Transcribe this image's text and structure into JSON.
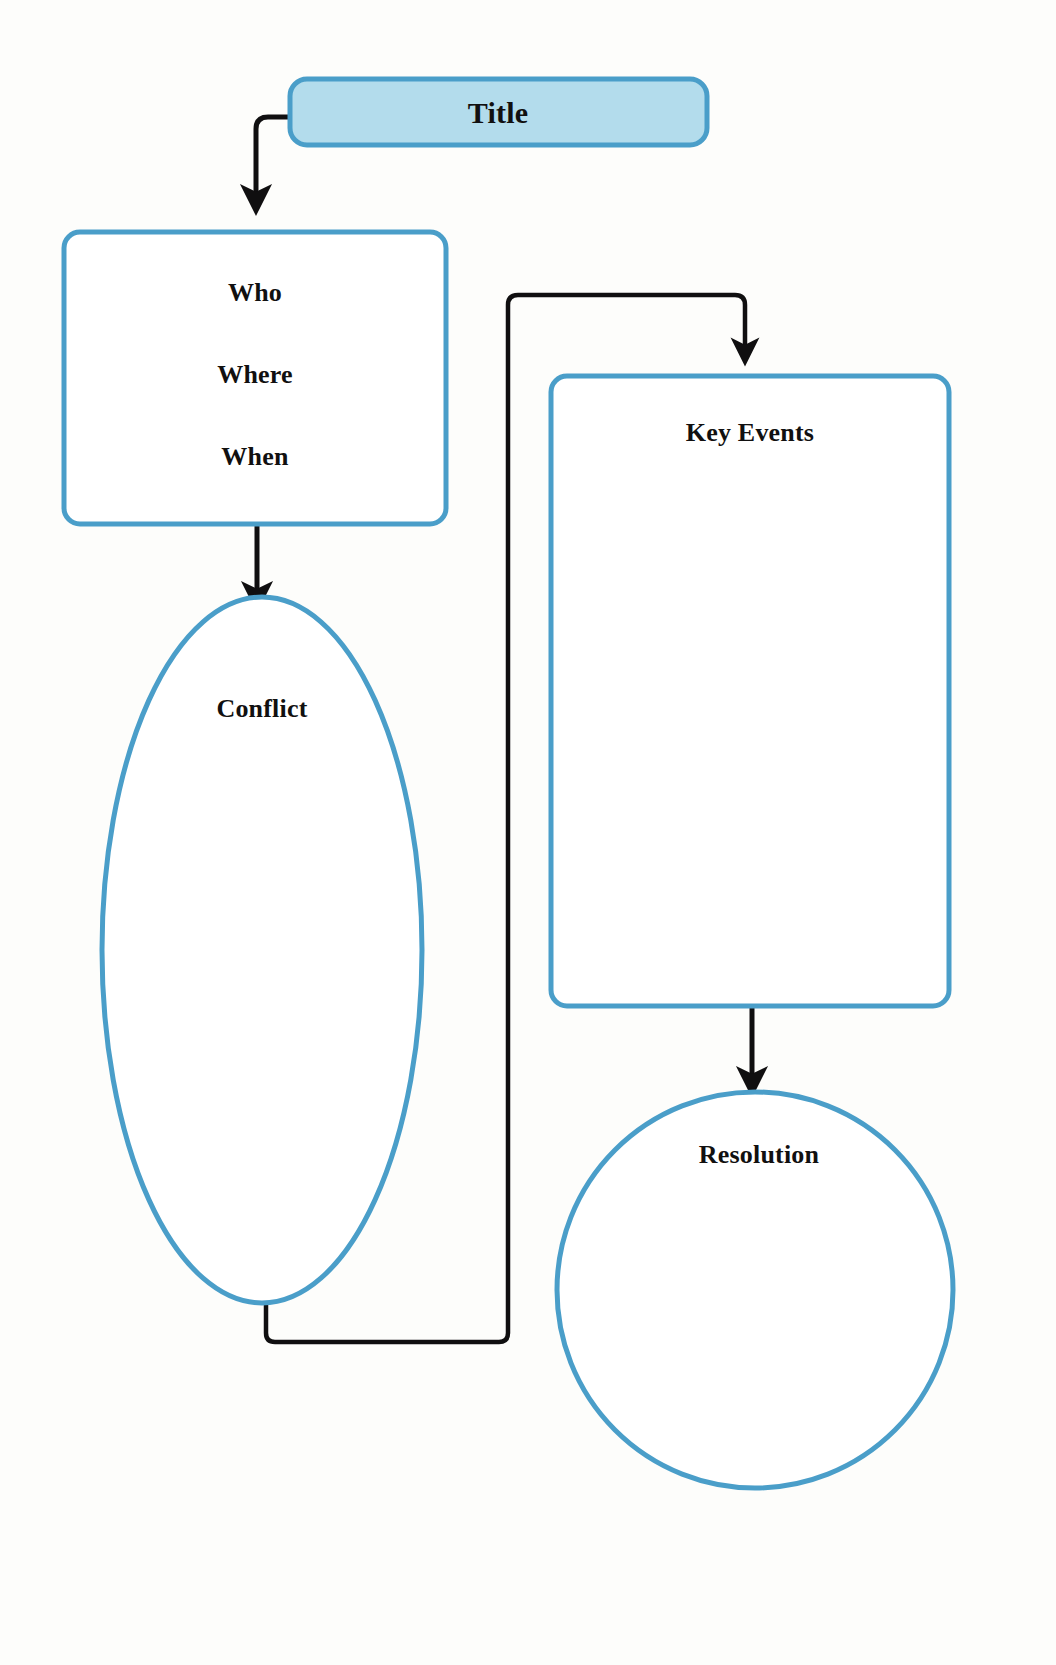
{
  "diagram": {
    "kind": "story-map-graphic-organizer",
    "background_color": "#fdfdfb",
    "shape_stroke_color": "#4a9ec9",
    "connector_color": "#100f10",
    "text_color": "#111010",
    "title_fill_color": "#b3dcec",
    "nodes": [
      {
        "id": "title",
        "label": "Title",
        "shape": "rounded-rectangle",
        "filled": true,
        "fill": "#b3dcec",
        "stroke": "#4a9ec9"
      },
      {
        "id": "who-where-when",
        "labels": [
          "Who",
          "Where",
          "When"
        ],
        "label_who": "Who",
        "label_where": "Where",
        "label_when": "When",
        "shape": "rounded-rectangle",
        "filled": false,
        "stroke": "#4a9ec9"
      },
      {
        "id": "conflict",
        "label": "Conflict",
        "shape": "ellipse",
        "filled": false,
        "stroke": "#4a9ec9"
      },
      {
        "id": "key-events",
        "label": "Key Events",
        "shape": "rounded-rectangle",
        "filled": false,
        "stroke": "#4a9ec9"
      },
      {
        "id": "resolution",
        "label": "Resolution",
        "shape": "circle",
        "filled": false,
        "stroke": "#4a9ec9"
      }
    ],
    "connectors": [
      {
        "id": "title-to-who",
        "from": "title",
        "to": "who-where-when",
        "style": "elbow",
        "arrow": "end"
      },
      {
        "id": "who-to-conflict",
        "from": "who-where-when",
        "to": "conflict",
        "style": "straight",
        "arrow": "end"
      },
      {
        "id": "conflict-to-key-events",
        "from": "conflict",
        "to": "key-events",
        "style": "elbow",
        "arrow": "end"
      },
      {
        "id": "key-events-to-resolution",
        "from": "key-events",
        "to": "resolution",
        "style": "straight",
        "arrow": "end"
      }
    ]
  }
}
